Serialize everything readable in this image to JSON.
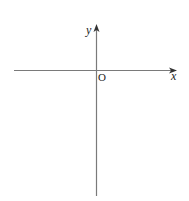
{
  "diagram": {
    "type": "cartesian-axes",
    "axes": {
      "x_label": "x",
      "y_label": "y",
      "origin_label": "O"
    },
    "colors": {
      "axis": "#7a7a7a",
      "text": "#222222",
      "background": "#ffffff"
    }
  }
}
